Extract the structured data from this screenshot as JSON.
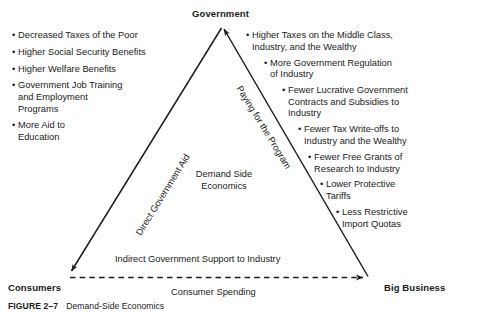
{
  "figure": {
    "number": "FIGURE 2–7",
    "title": "Demand-Side Economics"
  },
  "diagram": {
    "center_label": "Demand Side\nEconomics",
    "vertices": {
      "top": "Government",
      "bottom_left": "Consumers",
      "bottom_right": "Big Business"
    },
    "edges": {
      "left_label": "Direct Government Aid",
      "right_label": "Paying for the Program",
      "bottom_above_label": "Indirect Government Support to Industry",
      "bottom_below_label": "Consumer Spending"
    },
    "left_list": [
      "Decreased Taxes of the Poor",
      "Higher Social Security Benefits",
      "Higher Welfare Benefits",
      "Government Job Training\nand Employment\nPrograms",
      "More Aid to\nEducation"
    ],
    "right_list": [
      "Higher Taxes on the Middle Class,\nIndustry, and the Wealthy",
      "More Government Regulation\nof Industry",
      "Fewer Lucrative Government\nContracts and Subsidies to\nIndustry",
      "Fewer Tax Write-offs to\nIndustry and the Wealthy",
      "Fewer Free Grants of\nResearch to Industry",
      "Lower Protective\nTariffs",
      "Less Restrictive\nImport Quotas"
    ],
    "bullet_glyph": "•",
    "right_list_indents": [
      0,
      18,
      36,
      52,
      62,
      74,
      90
    ],
    "colors": {
      "ink": "#1a1a1a",
      "background": "#ffffff"
    }
  }
}
